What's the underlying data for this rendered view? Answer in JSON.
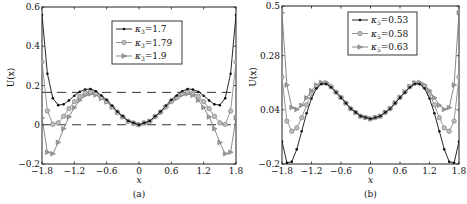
{
  "chart_data": [
    {
      "type": "line",
      "panel_label": "(a)",
      "xlabel": "x",
      "ylabel": "U(x)",
      "xlim": [
        -1.8,
        1.8
      ],
      "ylim": [
        -0.2,
        0.6
      ],
      "xticks": [
        -1.8,
        -1.2,
        -0.6,
        0,
        0.6,
        1.2,
        1.8
      ],
      "xtick_labels": [
        "−1.8",
        "−1.2",
        "−0.6",
        "0",
        "0.6",
        "1.2",
        "1.8"
      ],
      "yticks": [
        -0.2,
        0,
        0.2,
        0.4,
        0.6
      ],
      "ytick_labels": [
        "−0.2",
        "0",
        "0.2",
        "0.4",
        "0.6"
      ],
      "grid": false,
      "legend_position": "upper center",
      "hlines_dashed": [
        0.165,
        0.0
      ],
      "x": [
        0,
        0.2,
        0.4,
        0.6,
        0.8,
        0.9,
        1.0,
        1.1,
        1.2,
        1.3,
        1.4,
        1.5,
        1.6,
        1.7,
        1.8
      ],
      "symmetric_about_zero": true,
      "series": [
        {
          "name": "κ₃=1.7",
          "legend_symbol": "κ",
          "legend_sub": "3",
          "legend_value": "=1.7",
          "marker": "dot",
          "color": "#111111",
          "values": [
            0,
            0.019,
            0.067,
            0.127,
            0.171,
            0.182,
            0.18,
            0.168,
            0.148,
            0.124,
            0.104,
            0.1,
            0.135,
            0.26,
            0.56
          ]
        },
        {
          "name": "κ₃=1.79",
          "legend_symbol": "κ",
          "legend_sub": "3",
          "legend_value": "=1.79",
          "marker": "circle",
          "color": "#8a8a8a",
          "values": [
            0,
            0.018,
            0.064,
            0.12,
            0.16,
            0.168,
            0.163,
            0.145,
            0.118,
            0.082,
            0.043,
            0.01,
            0.002,
            0.07,
            0.32
          ]
        },
        {
          "name": "κ₃=1.9",
          "legend_symbol": "κ",
          "legend_sub": "3",
          "legend_value": "=1.9",
          "marker": "triangle",
          "color": "#7a7a7a",
          "values": [
            0,
            0.018,
            0.062,
            0.116,
            0.152,
            0.158,
            0.15,
            0.125,
            0.088,
            0.04,
            -0.02,
            -0.09,
            -0.148,
            -0.14,
            0.035
          ]
        }
      ]
    },
    {
      "type": "line",
      "panel_label": "(b)",
      "xlabel": "x",
      "ylabel": "U(x)",
      "xlim": [
        -1.8,
        1.8
      ],
      "ylim": [
        -0.2,
        0.5
      ],
      "xticks": [
        -1.8,
        -1.2,
        -0.6,
        0,
        0.6,
        1.2,
        1.8
      ],
      "xtick_labels": [
        "−1.8",
        "−1.2",
        "−0.6",
        "0",
        "0.6",
        "1.2",
        "1.8"
      ],
      "yticks": [
        -0.2,
        0.04,
        0.28,
        0.5
      ],
      "ytick_labels": [
        "−0.2",
        "0.04",
        "0.28",
        "0.5"
      ],
      "grid": false,
      "legend_position": "upper center",
      "x": [
        0,
        0.2,
        0.4,
        0.6,
        0.8,
        0.9,
        1.0,
        1.1,
        1.2,
        1.3,
        1.4,
        1.5,
        1.6,
        1.7,
        1.8
      ],
      "symmetric_about_zero": true,
      "series": [
        {
          "name": "κ₅=0.53",
          "legend_symbol": "κ",
          "legend_sub": "5",
          "legend_value": "=0.53",
          "marker": "dot",
          "color": "#111111",
          "values": [
            0.0,
            0.012,
            0.045,
            0.094,
            0.14,
            0.155,
            0.155,
            0.135,
            0.09,
            0.025,
            -0.055,
            -0.135,
            -0.19,
            -0.195,
            -0.1
          ]
        },
        {
          "name": "κ₅=0.58",
          "legend_symbol": "κ",
          "legend_sub": "5",
          "legend_value": "=0.58",
          "marker": "circle",
          "color": "#8a8a8a",
          "values": [
            0.0,
            0.012,
            0.045,
            0.095,
            0.142,
            0.158,
            0.158,
            0.142,
            0.11,
            0.062,
            0.005,
            -0.04,
            -0.055,
            -0.01,
            0.185
          ]
        },
        {
          "name": "κ₅=0.63",
          "legend_symbol": "κ",
          "legend_sub": "5",
          "legend_value": "=0.63",
          "marker": "triangle",
          "color": "#7a7a7a",
          "values": [
            0.0,
            0.012,
            0.046,
            0.096,
            0.144,
            0.16,
            0.161,
            0.15,
            0.125,
            0.093,
            0.06,
            0.042,
            0.05,
            0.15,
            0.47
          ]
        }
      ]
    }
  ]
}
